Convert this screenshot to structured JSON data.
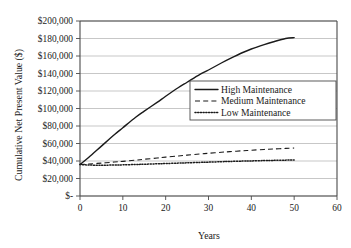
{
  "chart_data": {
    "type": "line",
    "title": "",
    "xlabel": "Years",
    "ylabel": "Cumulative Net Present Value ($)",
    "xlim": [
      0,
      60
    ],
    "ylim": [
      0,
      200000
    ],
    "grid": "horizontal",
    "legend_position": "center-right",
    "x_ticks": [
      0,
      10,
      20,
      30,
      40,
      50,
      60
    ],
    "x_tick_labels": [
      "0",
      "10",
      "20",
      "30",
      "40",
      "50",
      "60"
    ],
    "y_ticks": [
      0,
      20000,
      40000,
      60000,
      80000,
      100000,
      120000,
      140000,
      160000,
      180000,
      200000
    ],
    "y_tick_labels": [
      "$-",
      "$20,000",
      "$40,000",
      "$60,000",
      "$80,000",
      "$100,000",
      "$120,000",
      "$140,000",
      "$160,000",
      "$180,000",
      "$200,000"
    ],
    "x": [
      0,
      2,
      5,
      8,
      10,
      13,
      15,
      18,
      20,
      23,
      25,
      28,
      30,
      33,
      35,
      38,
      40,
      43,
      45,
      48,
      50
    ],
    "series": [
      {
        "name": "High Maintenance",
        "style": "solid",
        "color": "#1a1a1a",
        "values": [
          36000,
          44000,
          57000,
          70000,
          78000,
          90000,
          97000,
          107000,
          114000,
          124000,
          130000,
          139000,
          144000,
          152000,
          157000,
          164000,
          168000,
          173000,
          176000,
          180000,
          181000
        ]
      },
      {
        "name": "Medium Maintenance",
        "style": "dashed",
        "color": "#1a1a1a",
        "values": [
          36000,
          36600,
          37600,
          38800,
          39600,
          41000,
          42000,
          43400,
          44400,
          45800,
          46700,
          48000,
          48800,
          50000,
          50700,
          51700,
          52300,
          53200,
          53700,
          54400,
          54800
        ]
      },
      {
        "name": "Low Maintenance",
        "style": "dotted",
        "color": "#1a1a1a",
        "values": [
          36000,
          35400,
          35200,
          35400,
          35600,
          36000,
          36300,
          36800,
          37100,
          37600,
          37900,
          38400,
          38700,
          39200,
          39500,
          39900,
          40100,
          40500,
          40700,
          41000,
          41200
        ]
      }
    ],
    "legend_entries": [
      {
        "label": "High Maintenance",
        "style": "solid"
      },
      {
        "label": "Medium Maintenance",
        "style": "dashed"
      },
      {
        "label": "Low Maintenance",
        "style": "dotted"
      }
    ]
  },
  "colors": {
    "background": "#ffffff",
    "gridline": "#b9b9b9",
    "axis": "#4a4a4a",
    "ink": "#1a1a1a"
  }
}
